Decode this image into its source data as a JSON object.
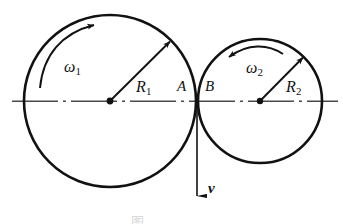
{
  "figure": {
    "type": "mechanics-diagram",
    "background_color": "#ffffff",
    "stroke_color": "#111111",
    "centerline_color": "#555555",
    "caption": "图"
  },
  "geometry": {
    "centerline": {
      "y": 101,
      "x_start": 12,
      "x_end": 338
    },
    "left_circle": {
      "cx": 110,
      "cy": 101,
      "r": 86
    },
    "right_circle": {
      "cx": 260,
      "cy": 101,
      "r": 62
    },
    "tangent_point": {
      "x": 197,
      "y": 101
    },
    "velocity_arrow": {
      "x": 197,
      "y_start": 101,
      "y_end": 196
    }
  },
  "labels": {
    "omega1": {
      "text": "ω",
      "sub": "1",
      "x": 64,
      "y": 59
    },
    "omega2": {
      "text": "ω",
      "sub": "2",
      "x": 246,
      "y": 60
    },
    "radius1": {
      "text": "R",
      "sub": "1",
      "x": 136,
      "y": 79
    },
    "radius2": {
      "text": "R",
      "sub": "2",
      "x": 286,
      "y": 79
    },
    "point_a": {
      "text": "A",
      "x": 177,
      "y": 79
    },
    "point_b": {
      "text": "B",
      "x": 205,
      "y": 79
    },
    "velocity": {
      "text": "v",
      "x": 208,
      "y": 181
    }
  },
  "annotations": {
    "omega1_direction": "clockwise",
    "omega2_direction": "counterclockwise",
    "velocity_direction": "downward"
  }
}
